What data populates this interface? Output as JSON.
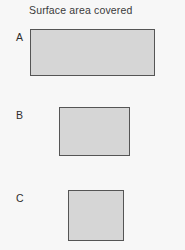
{
  "figure": {
    "title": "Surface area covered",
    "background_color": "#f7f7f7",
    "fill_color": "#d6d6d6",
    "border_color": "#555555",
    "text_color": "#3a3a3a"
  },
  "chart_data": {
    "type": "bar",
    "title": "Surface area covered",
    "xlabel": "",
    "ylabel": "",
    "orientation": "horizontal-rectangles",
    "categories": [
      "A",
      "B",
      "C"
    ],
    "values": [
      5875,
      3479,
      2856
    ],
    "value_unit": "px^2",
    "grid": false,
    "legend": null,
    "items": [
      {
        "label": "A",
        "width": 125,
        "height": 47,
        "area": 5875,
        "x": 30,
        "y": 29
      },
      {
        "label": "B",
        "width": 71,
        "height": 49,
        "area": 3479,
        "x": 59,
        "y": 107
      },
      {
        "label": "C",
        "width": 56,
        "height": 51,
        "area": 2856,
        "x": 68,
        "y": 190
      }
    ]
  }
}
